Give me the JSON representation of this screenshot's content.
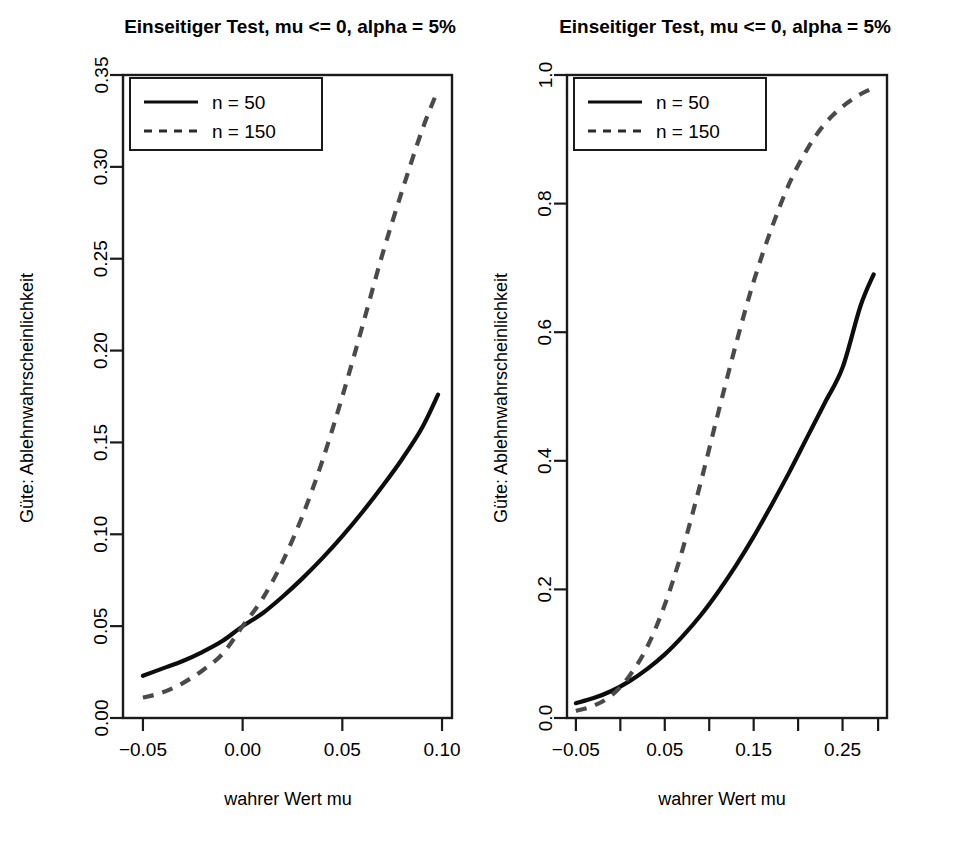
{
  "figure": {
    "background": "#ffffff",
    "foreground": "#000000",
    "panel_count": 2
  },
  "chart_data": [
    {
      "type": "line",
      "panel": "left",
      "title": "Einseitiger Test, mu <= 0, alpha = 5%",
      "xlabel": "wahrer Wert mu",
      "ylabel": "Güte: Ablehnwahrscheinlichkeit",
      "xlim": [
        -0.06,
        0.105
      ],
      "ylim": [
        0.0,
        0.35
      ],
      "xticks": [
        -0.05,
        0.0,
        0.05,
        0.1
      ],
      "xticklabels": [
        "-0.05",
        "0.00",
        "0.05",
        "0.10"
      ],
      "yticks": [
        0.0,
        0.05,
        0.1,
        0.15,
        0.2,
        0.25,
        0.3,
        0.35
      ],
      "yticklabels": [
        "0.00",
        "0.05",
        "0.10",
        "0.15",
        "0.20",
        "0.25",
        "0.30",
        "0.35"
      ],
      "grid": false,
      "legend_position": "top-left",
      "series": [
        {
          "name": "n = 50",
          "style": "solid",
          "color": "#0d0d0d",
          "x": [
            -0.05,
            -0.04,
            -0.03,
            -0.02,
            -0.01,
            0.0,
            0.01,
            0.02,
            0.03,
            0.04,
            0.05,
            0.06,
            0.07,
            0.08,
            0.09,
            0.098
          ],
          "y": [
            0.023,
            0.027,
            0.031,
            0.036,
            0.042,
            0.05,
            0.057,
            0.066,
            0.076,
            0.087,
            0.099,
            0.112,
            0.126,
            0.141,
            0.158,
            0.176
          ]
        },
        {
          "name": "n = 150",
          "style": "dashed",
          "color": "#4a4a4a",
          "x": [
            -0.05,
            -0.04,
            -0.03,
            -0.02,
            -0.01,
            0.0,
            0.01,
            0.02,
            0.03,
            0.04,
            0.05,
            0.06,
            0.07,
            0.08,
            0.09,
            0.098
          ],
          "y": [
            0.011,
            0.014,
            0.019,
            0.026,
            0.035,
            0.05,
            0.065,
            0.085,
            0.11,
            0.14,
            0.175,
            0.213,
            0.252,
            0.287,
            0.32,
            0.342
          ]
        }
      ]
    },
    {
      "type": "line",
      "panel": "right",
      "title": "Einseitiger Test, mu <= 0, alpha = 5%",
      "xlabel": "wahrer Wert mu",
      "ylabel": "Güte: Ablehnwahrscheinlichkeit",
      "xlim": [
        -0.06,
        0.3
      ],
      "ylim": [
        0.0,
        1.0
      ],
      "xticks": [
        -0.05,
        0.0,
        0.05,
        0.1,
        0.15,
        0.2,
        0.25,
        0.29
      ],
      "xticklabels": [
        "-0.05",
        "",
        "0.05",
        "",
        "0.15",
        "",
        "0.25",
        ""
      ],
      "yticks": [
        0.0,
        0.2,
        0.4,
        0.6,
        0.8,
        1.0
      ],
      "yticklabels": [
        "0.0",
        "0.2",
        "0.4",
        "0.6",
        "0.8",
        "1.0"
      ],
      "grid": false,
      "legend_position": "top-left",
      "series": [
        {
          "name": "n = 50",
          "style": "solid",
          "color": "#0d0d0d",
          "x": [
            -0.05,
            -0.03,
            -0.01,
            0.01,
            0.03,
            0.05,
            0.07,
            0.09,
            0.11,
            0.13,
            0.15,
            0.17,
            0.19,
            0.21,
            0.23,
            0.25,
            0.27,
            0.285
          ],
          "y": [
            0.023,
            0.031,
            0.042,
            0.057,
            0.076,
            0.099,
            0.127,
            0.159,
            0.196,
            0.237,
            0.282,
            0.331,
            0.382,
            0.436,
            0.49,
            0.545,
            0.64,
            0.69
          ]
        },
        {
          "name": "n = 150",
          "style": "dashed",
          "color": "#4a4a4a",
          "x": [
            -0.05,
            -0.03,
            -0.01,
            0.01,
            0.03,
            0.05,
            0.07,
            0.09,
            0.11,
            0.13,
            0.15,
            0.17,
            0.19,
            0.21,
            0.23,
            0.25,
            0.27,
            0.285
          ],
          "y": [
            0.011,
            0.019,
            0.035,
            0.065,
            0.11,
            0.176,
            0.262,
            0.364,
            0.474,
            0.581,
            0.679,
            0.761,
            0.831,
            0.884,
            0.924,
            0.951,
            0.97,
            0.98
          ]
        }
      ]
    }
  ],
  "panels": [
    {
      "id": "left",
      "title": "Einseitiger Test, mu <= 0, alpha = 5%",
      "xlabel": "wahrer Wert mu",
      "ylabel": "Güte: Ablehnwahrscheinlichkeit",
      "legend": {
        "items": [
          {
            "label": "n = 50",
            "style": "solid"
          },
          {
            "label": "n = 150",
            "style": "dashed"
          }
        ]
      }
    },
    {
      "id": "right",
      "title": "Einseitiger Test, mu <= 0, alpha = 5%",
      "xlabel": "wahrer Wert mu",
      "ylabel": "Güte: Ablehnwahrscheinlichkeit",
      "legend": {
        "items": [
          {
            "label": "n = 50",
            "style": "solid"
          },
          {
            "label": "n = 150",
            "style": "dashed"
          }
        ]
      }
    }
  ]
}
